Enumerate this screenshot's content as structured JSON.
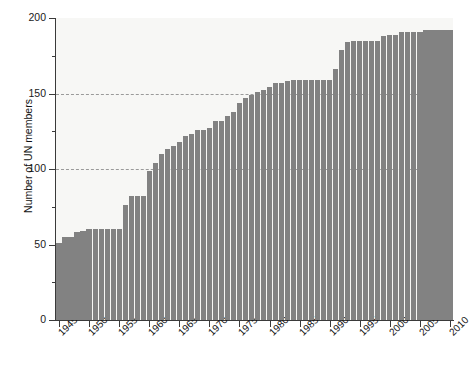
{
  "chart_data": {
    "type": "bar",
    "title": "",
    "subtitle": "",
    "xlabel": "",
    "ylabel": "Number of UN members",
    "xlim": [
      1944.5,
      2010.5
    ],
    "ylim": [
      0,
      200
    ],
    "grid": "horizontal dashed gridlines at 100 and 150 only",
    "gridline_values": [
      100,
      150
    ],
    "legend": "none",
    "y_major_ticks": [
      0,
      50,
      100,
      150,
      200
    ],
    "y_minor_ticks": [
      25,
      75,
      125,
      175
    ],
    "y_tick_labels": [
      "0",
      "50",
      "100",
      "150",
      "200"
    ],
    "x_tick_values": [
      1945,
      1950,
      1955,
      1960,
      1965,
      1970,
      1975,
      1980,
      1985,
      1990,
      1995,
      2000,
      2005,
      2010
    ],
    "x_tick_labels": [
      "1945",
      "1950",
      "1955",
      "1960",
      "1965",
      "1970",
      "1975",
      "1980",
      "1985",
      "1990",
      "1995",
      "2000",
      "2005",
      "2010"
    ],
    "bar_color": "#828282",
    "plot_background": "#f7f7f5",
    "categories": [
      1945,
      1946,
      1947,
      1948,
      1949,
      1950,
      1951,
      1952,
      1953,
      1954,
      1955,
      1956,
      1957,
      1958,
      1959,
      1960,
      1961,
      1962,
      1963,
      1964,
      1965,
      1966,
      1967,
      1968,
      1969,
      1970,
      1971,
      1972,
      1973,
      1974,
      1975,
      1976,
      1977,
      1978,
      1979,
      1980,
      1981,
      1982,
      1983,
      1984,
      1985,
      1986,
      1987,
      1988,
      1989,
      1990,
      1991,
      1992,
      1993,
      1994,
      1995,
      1996,
      1997,
      1998,
      1999,
      2000,
      2001,
      2002,
      2003,
      2004,
      2005,
      2006,
      2007,
      2008,
      2009,
      2010
    ],
    "values": [
      51,
      55,
      55,
      58,
      59,
      60,
      60,
      60,
      60,
      60,
      60,
      76,
      82,
      82,
      82,
      99,
      104,
      110,
      113,
      115,
      118,
      122,
      123,
      126,
      126,
      127,
      132,
      132,
      135,
      138,
      144,
      147,
      149,
      151,
      152,
      154,
      157,
      157,
      158,
      159,
      159,
      159,
      159,
      159,
      159,
      159,
      166,
      179,
      184,
      185,
      185,
      185,
      185,
      185,
      188,
      189,
      189,
      191,
      191,
      191,
      191,
      192,
      192,
      192,
      192,
      192
    ]
  }
}
